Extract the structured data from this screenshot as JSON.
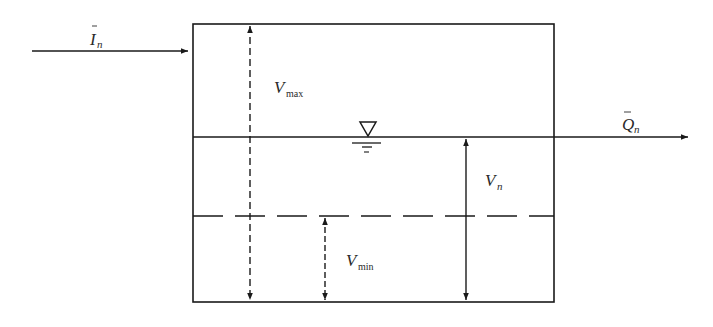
{
  "diagram": {
    "type": "reservoir-storage-schematic",
    "inflow": {
      "symbol": "I",
      "subscript": "n",
      "overbar": true
    },
    "outflow": {
      "symbol": "Q",
      "subscript": "n",
      "overbar": true
    },
    "storage_max": {
      "symbol": "V",
      "subscript": "max"
    },
    "storage_current": {
      "symbol": "V",
      "subscript": "n"
    },
    "storage_min": {
      "symbol": "V",
      "subscript": "min"
    },
    "water_level_icon": "water-surface-triangle-icon"
  },
  "colors": {
    "line": "#1a1a1a",
    "background": "#ffffff"
  }
}
